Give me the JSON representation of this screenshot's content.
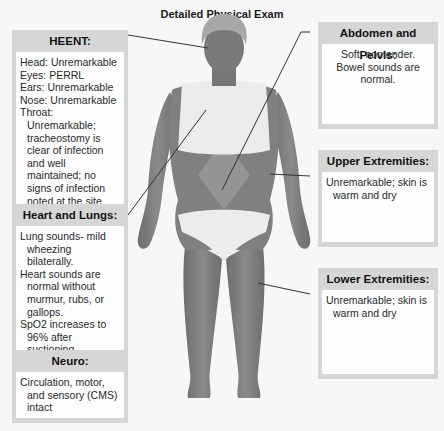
{
  "title": "Detailed Physical Exam",
  "colors": {
    "background": "#f7f7f7",
    "box_header": "#d6d6d6",
    "box_body": "#fdfdfd",
    "skin": "#7c7c7c",
    "skin_light": "#a4a4a4",
    "clothing": "#ececec",
    "leader_line": "#333333"
  },
  "boxes": {
    "heent": {
      "header": "HEENT:",
      "lines": [
        "Head: Unremarkable",
        "Eyes: PERRL",
        "Ears: Unremarkable",
        "Nose: Unremarkable",
        "Throat: Unremarkable; tracheostomy is clear of infection and well maintained; no signs of infection noted at the site"
      ]
    },
    "heart_lungs": {
      "header": "Heart and Lungs:",
      "lines": [
        "Lung sounds- mild wheezing bilaterally.",
        "Heart sounds are normal without murmur, rubs, or gallops.",
        "SpO2 increases to 96% after suctioning."
      ]
    },
    "neuro": {
      "header": "Neuro:",
      "lines": [
        "Circulation, motor, and sensory (CMS) intact"
      ]
    },
    "abdomen": {
      "header": "Abdomen and Pelvis:",
      "lines": [
        "Soft, nontender. Bowel sounds are normal."
      ]
    },
    "upper_ext": {
      "header": "Upper Extremities:",
      "lines": [
        "Unremarkable; skin is warm and dry"
      ]
    },
    "lower_ext": {
      "header": "Lower Extremities:",
      "lines": [
        "Unremarkable; skin is warm and dry"
      ]
    }
  }
}
